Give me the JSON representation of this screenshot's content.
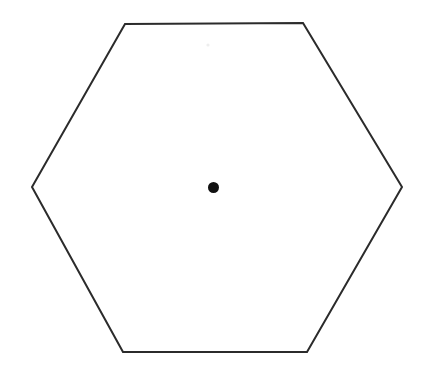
{
  "figure": {
    "canvas": {
      "width": 423,
      "height": 375,
      "background_color": "#ffffff"
    },
    "shape": {
      "name": "hexagon",
      "type": "regular-polygon",
      "sides": 6,
      "orientation": "flat-top",
      "stroke_color": "#2b2b2b",
      "stroke_width": 2,
      "fill_color": "none",
      "points_attr": "125,24 303,23 402,187 307,352 123,352 32,187",
      "vertices": [
        {
          "label": "top-left",
          "x": 125,
          "y": 24
        },
        {
          "label": "top-right",
          "x": 303,
          "y": 23
        },
        {
          "label": "right",
          "x": 402,
          "y": 187
        },
        {
          "label": "bottom-right",
          "x": 307,
          "y": 352
        },
        {
          "label": "bottom-left",
          "x": 123,
          "y": 352
        },
        {
          "label": "left",
          "x": 32,
          "y": 187
        }
      ]
    },
    "center_point": {
      "name": "center-dot",
      "x": 213.5,
      "y": 187.5,
      "radius": 5.5,
      "fill_color": "#111111"
    },
    "speck": {
      "name": "scan-speck",
      "x": 208,
      "y": 45,
      "radius": 1.6,
      "fill_color": "#eeeeee"
    }
  },
  "chart_data": {
    "type": "scatter",
    "subtitle": "",
    "xlabel": "",
    "ylabel": "",
    "grid": false,
    "legend_position": "none",
    "xlim": [
      0,
      423
    ],
    "ylim": [
      0,
      375
    ],
    "series": [
      {
        "name": "hexagon outline",
        "render": "closed-polyline",
        "x": [
          125,
          303,
          402,
          307,
          123,
          32
        ],
        "y": [
          24,
          23,
          187,
          352,
          352,
          187
        ]
      },
      {
        "name": "center point",
        "render": "marker",
        "x": [
          213.5
        ],
        "y": [
          187.5
        ]
      }
    ],
    "annotations": []
  }
}
